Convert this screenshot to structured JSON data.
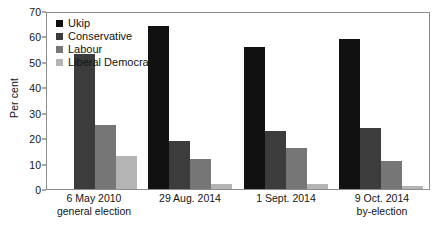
{
  "chart_data": {
    "type": "bar",
    "title": "",
    "xlabel": "",
    "ylabel": "Per cent",
    "ylim": [
      0,
      70
    ],
    "yticks": [
      0,
      10,
      20,
      30,
      40,
      50,
      60,
      70
    ],
    "grid": false,
    "legend_position": "top-left inside plot",
    "categories": [
      "6 May 2010 general election",
      "29 Aug. 2014",
      "1 Sept. 2014",
      "9 Oct. 2014 by-election"
    ],
    "category_lines": [
      {
        "line1": "6 May 2010",
        "line2": "general election"
      },
      {
        "line1": "29 Aug. 2014",
        "line2": ""
      },
      {
        "line1": "1 Sept. 2014",
        "line2": ""
      },
      {
        "line1": "9 Oct. 2014",
        "line2": "by-election"
      }
    ],
    "series": [
      {
        "name": "Ukip",
        "color": "#111111",
        "values": [
          0,
          64,
          56,
          59
        ]
      },
      {
        "name": "Conservative",
        "color": "#3c3c3c",
        "values": [
          53,
          19,
          23,
          24
        ]
      },
      {
        "name": "Labour",
        "color": "#767676",
        "values": [
          25,
          12,
          16,
          11
        ]
      },
      {
        "name": "Liberal Democrat",
        "color": "#b4b4b4",
        "values": [
          13,
          2,
          2,
          1
        ]
      }
    ]
  },
  "caption": {
    "text": ""
  }
}
